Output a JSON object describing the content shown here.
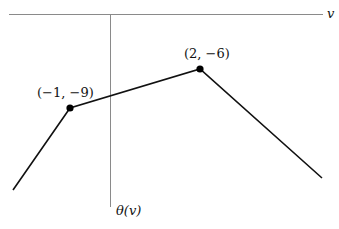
{
  "diagram": {
    "type": "piecewise-linear concave function plot",
    "axes": {
      "horizontal_label": "v",
      "vertical_label": "θ(v)"
    },
    "points": [
      {
        "label": "(−1, −9)",
        "x": -1,
        "y": -9
      },
      {
        "label": "(2, −6)",
        "x": 2,
        "y": -6
      }
    ],
    "colors": {
      "axis": "#8a8a8a",
      "curve": "#111111",
      "point": "#000000"
    }
  }
}
